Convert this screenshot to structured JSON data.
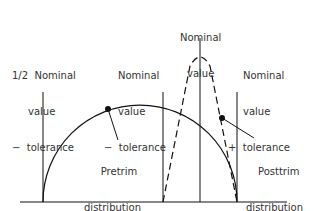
{
  "labels": {
    "lower_half": {
      "line1": "1/2  Nominal",
      "line2": "value",
      "line3": "−  tolerance"
    },
    "lower": {
      "line1": "Nominal",
      "line2": "value",
      "line3": "−  tolerance"
    },
    "nominal": {
      "line1": "Nominal",
      "line2": "value"
    },
    "upper": {
      "line1": "Nominal",
      "line2": "value",
      "line3": "+  tolerance"
    },
    "pretrim": {
      "line1": "Pretrim",
      "line2": "distribution"
    },
    "posttrim": {
      "line1": "Posttrim",
      "line2": "distribution"
    }
  },
  "colors": {
    "line": "#111111",
    "text": "#333333"
  }
}
